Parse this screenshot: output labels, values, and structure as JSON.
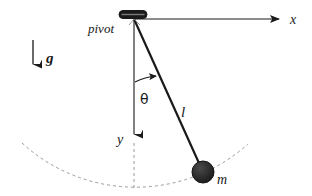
{
  "figure": {
    "background_color": "#ffffff",
    "stroke_color": "#1a1a1a",
    "bob_color": "#262626",
    "dashed_color": "#9a9a9a"
  },
  "labels": {
    "pivot": "pivot",
    "gravity": "g",
    "x_axis": "x",
    "y_axis": "y",
    "theta": "θ",
    "length": "l",
    "mass": "m"
  },
  "geometry": {
    "pivot_point": {
      "x": 134,
      "y": 19
    },
    "bob_center": {
      "x": 203,
      "y": 172
    },
    "bob_radius": 11,
    "rod_length_px": 168,
    "angle_degrees": 24,
    "x_axis_end": {
      "x": 282,
      "y": 19
    },
    "y_axis_end": {
      "x": 134,
      "y": 143
    },
    "gravity_arrow": {
      "x": 33,
      "y_start": 40,
      "y_end": 72
    },
    "arc_radius_px": 168
  },
  "label_positions": {
    "pivot": {
      "x": 88,
      "y": 33
    },
    "gravity": {
      "x": 46,
      "y": 63
    },
    "x_axis": {
      "x": 290,
      "y": 24
    },
    "y_axis": {
      "x": 117,
      "y": 144
    },
    "theta": {
      "x": 140,
      "y": 104
    },
    "length": {
      "x": 181,
      "y": 117
    },
    "mass": {
      "x": 217,
      "y": 184
    }
  }
}
